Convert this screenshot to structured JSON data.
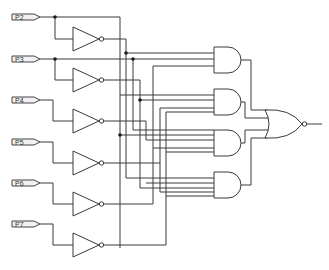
{
  "diagram": {
    "type": "combinational-logic-circuit",
    "inputs": [
      {
        "id": "P2",
        "label": "P2",
        "y": 17
      },
      {
        "id": "P3",
        "label": "P3",
        "y": 59
      },
      {
        "id": "P4",
        "label": "P4",
        "y": 100
      },
      {
        "id": "P5",
        "label": "P5",
        "y": 142
      },
      {
        "id": "P6",
        "label": "P6",
        "y": 183
      },
      {
        "id": "P7",
        "label": "P7",
        "y": 224
      }
    ],
    "inverters": [
      {
        "id": "NOT1",
        "input": "P2",
        "y": 39
      },
      {
        "id": "NOT2",
        "input": "P3",
        "y": 80
      },
      {
        "id": "NOT3",
        "input": "P4",
        "y": 121
      },
      {
        "id": "NOT4",
        "input": "P5",
        "y": 163
      },
      {
        "id": "NOT5",
        "input": "P6",
        "y": 204
      },
      {
        "id": "NOT6",
        "input": "P7",
        "y": 245
      }
    ],
    "and_gates": [
      {
        "id": "AND1",
        "y": 60
      },
      {
        "id": "AND2",
        "y": 102
      },
      {
        "id": "AND3",
        "y": 143
      },
      {
        "id": "AND4",
        "y": 185
      }
    ],
    "output_gate": {
      "id": "NOR1",
      "type": "NOR",
      "inputs": 4,
      "y": 124
    },
    "colors": {
      "line": "#3a3a3a",
      "background": "#ffffff",
      "junction": "#1a1a1a"
    }
  }
}
